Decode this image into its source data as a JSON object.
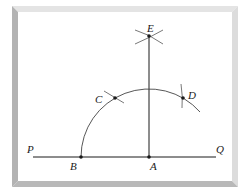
{
  "diagram": {
    "type": "geometric-construction",
    "line": {
      "endpoints": [
        "P",
        "Q"
      ]
    },
    "labels": {
      "P": "P",
      "Q": "Q",
      "A": "A",
      "B": "B",
      "C": "C",
      "D": "D",
      "E": "E"
    },
    "points": [
      {
        "name": "A",
        "label": "A",
        "on": "line PQ"
      },
      {
        "name": "B",
        "label": "B",
        "on": "line PQ"
      },
      {
        "name": "C",
        "label": "C",
        "on": "arc"
      },
      {
        "name": "D",
        "label": "D",
        "on": "arc"
      },
      {
        "name": "E",
        "label": "E",
        "on": "perpendicular through A"
      }
    ],
    "segments": [
      {
        "from": "P",
        "to": "Q"
      },
      {
        "from": "A",
        "to": "E"
      }
    ],
    "arcs": [
      {
        "center": "A",
        "from": "B",
        "through": [
          "C",
          "D"
        ]
      }
    ],
    "colors": {
      "ink": "#1a1a1a",
      "arc": "#444444",
      "frame_left": "#b3b3b3",
      "frame_top": "#e4e4e4",
      "frame_right": "#dcdcdc",
      "frame_bottom": "#b8b8b8",
      "paper": "#ffffff"
    }
  }
}
